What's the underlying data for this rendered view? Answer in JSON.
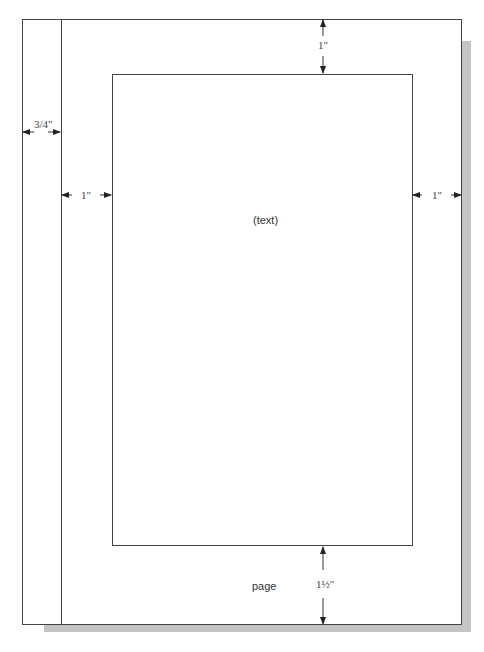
{
  "diagram": {
    "labels": {
      "binding": "3/4\"",
      "top": "1\"",
      "left": "1\"",
      "right": "1\"",
      "bottom": "1½\"",
      "text_area": "(text)",
      "page": "page"
    },
    "margins_inches": {
      "binding": 0.75,
      "top": 1,
      "left": 1,
      "right": 1,
      "bottom": 1.5
    }
  }
}
